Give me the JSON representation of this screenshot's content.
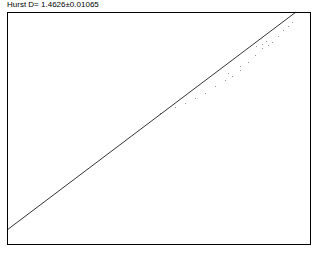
{
  "title": "Hurst D=  1.4626±0.01065",
  "chart_data": {
    "type": "scatter",
    "title": "Hurst D=  1.4626±0.01065",
    "xlabel": "",
    "ylabel": "",
    "grid": false,
    "legend": null,
    "hurst_D": 1.4626,
    "hurst_D_error": 0.01065,
    "fit_line": {
      "x0_px": 7,
      "y0_px": 230,
      "x1_px": 296,
      "y1_px": 12
    },
    "points_px": [
      [
        160,
        113
      ],
      [
        175,
        107
      ],
      [
        185,
        103
      ],
      [
        195,
        98
      ],
      [
        205,
        93
      ],
      [
        215,
        86
      ],
      [
        225,
        80
      ],
      [
        232,
        76
      ],
      [
        240,
        70
      ],
      [
        248,
        62
      ],
      [
        255,
        55
      ],
      [
        262,
        48
      ],
      [
        268,
        45
      ],
      [
        272,
        42
      ],
      [
        278,
        36
      ],
      [
        283,
        30
      ],
      [
        288,
        26
      ],
      [
        292,
        22
      ],
      [
        256,
        46
      ],
      [
        262,
        44
      ],
      [
        266,
        41
      ],
      [
        240,
        66
      ],
      [
        228,
        73
      ]
    ],
    "plot_box_px": {
      "left": 7,
      "top": 12,
      "right": 310,
      "bottom": 244
    }
  }
}
